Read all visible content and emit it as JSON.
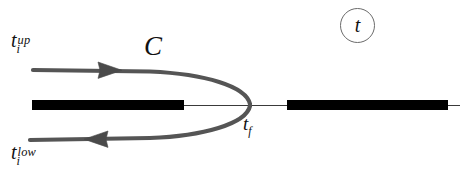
{
  "figure": {
    "background_color": "#ffffff",
    "width": 460,
    "height": 177
  },
  "labels": {
    "initial_time_upper": {
      "base": "t",
      "sub": "i",
      "sup": "up",
      "text": "t_i^{up}"
    },
    "initial_time_lower": {
      "base": "t",
      "sub": "i",
      "sup": "low",
      "text": "t_i^{low}"
    },
    "contour_name": "C",
    "final_time": {
      "base": "t",
      "sub": "f",
      "text": "t_f"
    },
    "axis_badge": "t"
  },
  "colors": {
    "contour": "#555555",
    "axis_bar": "#000000",
    "axis_line": "#333333",
    "badge_ring": "#6b6b6b",
    "text": "#111111"
  },
  "geometry": {
    "axis_y": 105,
    "bar_left": {
      "x_start": 32,
      "x_end": 184,
      "thickness": 10
    },
    "bar_right": {
      "x_start": 287,
      "x_end": 448,
      "thickness": 10
    },
    "thin_axis": {
      "x_start": 184,
      "x_end": 460
    },
    "contour_start_upper": {
      "x": 33,
      "y": 70
    },
    "contour_start_lower": {
      "x": 30,
      "y": 140
    },
    "turning_point": {
      "x": 253,
      "y": 105
    },
    "arrow_upper": {
      "x": 110,
      "y": 69,
      "direction": "right"
    },
    "arrow_lower": {
      "x": 95,
      "y": 139,
      "direction": "left"
    }
  }
}
